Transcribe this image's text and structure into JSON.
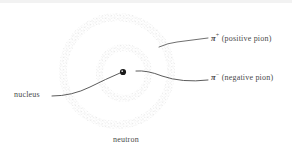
{
  "figure": {
    "background": "#ffffff",
    "stipple_color": "#b9b9b9",
    "line_color": "#4a4a4a",
    "nucleus_color": "#1a1a1a"
  },
  "labels": {
    "pi_plus": {
      "symbol": "π",
      "superscript": "+",
      "text": "(positive pion)",
      "full": "π⁺ (positive pion)"
    },
    "pi_minus": {
      "symbol": "π",
      "superscript": "−",
      "text": "(negative pion)",
      "full": "π⁻ (negative pion)"
    },
    "nucleus": {
      "text": "nucleus"
    },
    "neutron": {
      "text": "neutron"
    }
  },
  "geometry": {
    "nucleus_point": {
      "cx": 123,
      "cy": 72,
      "r": 3
    },
    "outer_ring": {
      "cx": 117,
      "cy": 71,
      "rx": 58,
      "ry": 58
    },
    "inner_ring": {
      "cx": 124,
      "cy": 73,
      "rx": 27,
      "ry": 28
    }
  },
  "leaders": {
    "pi_plus_path": "M 208 38 L 177 42 Q 168 43 159 47",
    "pi_minus_path": "M 208 80 Q 180 82 160 76 Q 146 71 136 71",
    "nucleus_path": "M 52 96 Q 70 96 88 88 Q 105 79 120 73"
  }
}
